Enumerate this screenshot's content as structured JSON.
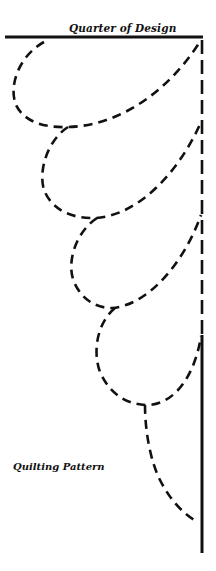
{
  "diagram": {
    "title": "Quarter of Design",
    "caption": "Quilting Pattern",
    "colors": {
      "ink": "#111111",
      "background": "#ffffff"
    },
    "stroke": {
      "solid_width": 3,
      "dash_width": 2.6,
      "dasharray": "9 6"
    }
  }
}
